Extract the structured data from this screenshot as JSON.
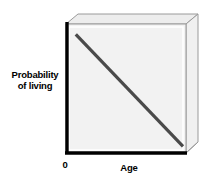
{
  "figure": {
    "background_color": "#ffffff",
    "front_face_color": "#f2f2f2",
    "top_face_color": "#ededed",
    "side_face_color": "#f0f0f0",
    "box_edge_color": "#9a9a9a",
    "axis_color": "#000000",
    "series_color": "#4a4a4a"
  },
  "labels": {
    "y_axis_line1": "Probability",
    "y_axis_line2": "of living",
    "x_axis": "Age",
    "origin": "0"
  },
  "chart_data": {
    "type": "line",
    "title": "",
    "xlabel": "Age",
    "ylabel": "Probability of living",
    "grid": false,
    "legend": null,
    "annotations": [],
    "xlim": [
      0,
      1
    ],
    "ylim": [
      0,
      1
    ],
    "xticks": [
      0
    ],
    "xticklabels": [
      "0"
    ],
    "yticks": [],
    "yticklabels": [],
    "series": [
      {
        "name": "Probability of living",
        "x": [
          0.06,
          1.0
        ],
        "y": [
          0.94,
          0.03
        ],
        "style": "solid",
        "linewidth": 3,
        "color": "#4a4a4a"
      }
    ]
  }
}
